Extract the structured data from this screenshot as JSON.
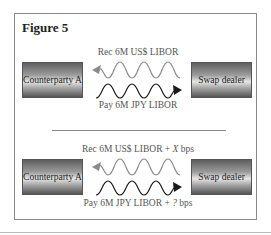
{
  "figure": {
    "title": "Figure 5",
    "panels": [
      {
        "left_party": "Counterparty A",
        "right_party": "Swap dealer",
        "receive_leg": {
          "label": "Rec 6M US$ LIBOR",
          "direction": "to-left",
          "color": "#8a8a8a"
        },
        "pay_leg": {
          "label": "Pay 6M JPY LIBOR",
          "direction": "to-right",
          "color": "#1a1a1a"
        }
      },
      {
        "left_party": "Counterparty A",
        "right_party": "Swap dealer",
        "receive_leg": {
          "label_prefix": "Rec 6M US$ LIBOR + ",
          "label_var": "X",
          "label_suffix": " bps",
          "direction": "to-left",
          "color": "#8a8a8a"
        },
        "pay_leg": {
          "label_prefix": "Pay 6M JPY LIBOR + ",
          "label_var": "?",
          "label_suffix": " bps",
          "direction": "to-right",
          "color": "#1a1a1a"
        }
      }
    ]
  }
}
